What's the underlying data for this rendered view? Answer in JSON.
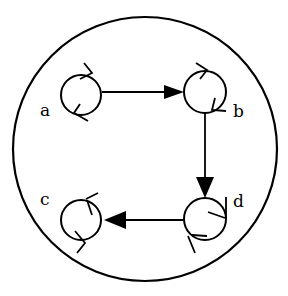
{
  "diagram": {
    "type": "state-transition",
    "boundary": "outer-circle",
    "nodes": [
      {
        "id": "a",
        "label": "a"
      },
      {
        "id": "b",
        "label": "b"
      },
      {
        "id": "c",
        "label": "c"
      },
      {
        "id": "d",
        "label": "d"
      }
    ],
    "edges": [
      {
        "from": "a",
        "to": "b"
      },
      {
        "from": "b",
        "to": "d"
      },
      {
        "from": "d",
        "to": "c"
      }
    ],
    "colors": {
      "stroke": "#000000",
      "background": "#ffffff"
    }
  }
}
